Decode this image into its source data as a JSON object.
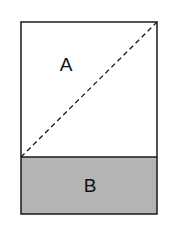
{
  "diagram": {
    "regions": [
      {
        "id": "A",
        "label": "A",
        "fill": "#ffffff"
      },
      {
        "id": "B",
        "label": "B",
        "fill": "#b4b4b4"
      }
    ],
    "stroke_color": "#1a1a1a",
    "diagonal": {
      "style": "dashed",
      "from": "bottom-left of A",
      "to": "top-right of A"
    }
  }
}
